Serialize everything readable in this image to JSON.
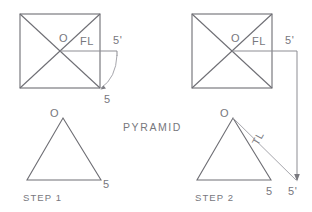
{
  "figure": {
    "title": "PYRAMID",
    "background_color": "#ffffff",
    "line_color": "#6e6e74",
    "text_color": "#77777d"
  },
  "steps": [
    {
      "caption": "STEP 1",
      "top_view": {
        "shape": "square-with-diagonals",
        "center_label": "O",
        "fold_line_label": "FL",
        "rotated_point_label": "5'",
        "revolved_point_label": "5",
        "arc": "rotation-arc-from-fold-line-to-corner"
      },
      "front_view": {
        "shape": "triangle",
        "apex_label": "O",
        "base_right_label": "5"
      }
    },
    {
      "caption": "STEP 2",
      "top_view": {
        "shape": "square-with-diagonals",
        "center_label": "O",
        "fold_line_label": "FL",
        "rotated_point_label": "5'",
        "projector": "vertical-projector-down-to-front-view"
      },
      "front_view": {
        "shape": "triangle",
        "apex_label": "O",
        "base_right_label": "5",
        "projected_point_label": "5'",
        "true_length_label": "TL"
      }
    }
  ]
}
